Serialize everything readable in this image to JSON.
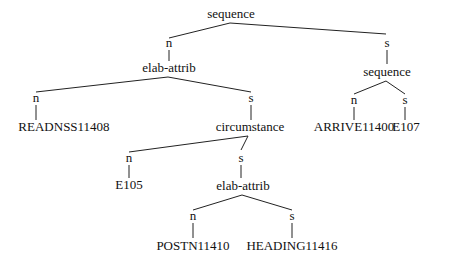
{
  "diagram": {
    "type": "rst-tree",
    "nodes": [
      {
        "id": "root",
        "label": "sequence",
        "x": 231,
        "y": 18
      },
      {
        "id": "n1",
        "label": "n",
        "x": 169,
        "y": 47
      },
      {
        "id": "s1",
        "label": "s",
        "x": 387,
        "y": 47
      },
      {
        "id": "elab1",
        "label": "elab-attrib",
        "x": 169,
        "y": 72
      },
      {
        "id": "seq2",
        "label": "sequence",
        "x": 387,
        "y": 76
      },
      {
        "id": "n2",
        "label": "n",
        "x": 36,
        "y": 102
      },
      {
        "id": "s2",
        "label": "s",
        "x": 251,
        "y": 102
      },
      {
        "id": "n5",
        "label": "n",
        "x": 354,
        "y": 104
      },
      {
        "id": "s5",
        "label": "s",
        "x": 405,
        "y": 104
      },
      {
        "id": "readnss",
        "label": "READNSS11408",
        "x": 64,
        "y": 131
      },
      {
        "id": "circ",
        "label": "circumstance",
        "x": 250,
        "y": 131
      },
      {
        "id": "arrive",
        "label": "ARRIVE11400",
        "x": 354,
        "y": 131
      },
      {
        "id": "e107",
        "label": "E107",
        "x": 406,
        "y": 131
      },
      {
        "id": "n3",
        "label": "n",
        "x": 129,
        "y": 162
      },
      {
        "id": "s3",
        "label": "s",
        "x": 241,
        "y": 162
      },
      {
        "id": "e105",
        "label": "E105",
        "x": 129,
        "y": 189
      },
      {
        "id": "elab2",
        "label": "elab-attrib",
        "x": 243,
        "y": 190
      },
      {
        "id": "n4",
        "label": "n",
        "x": 193,
        "y": 220
      },
      {
        "id": "s4",
        "label": "s",
        "x": 292,
        "y": 220
      },
      {
        "id": "postn",
        "label": "POSTN11410",
        "x": 193,
        "y": 250
      },
      {
        "id": "heading",
        "label": "HEADING11416",
        "x": 292,
        "y": 250
      }
    ],
    "edges": [
      {
        "from": "root",
        "to": "n1",
        "x1": 230,
        "y1": 23,
        "x2": 169,
        "y2": 38
      },
      {
        "from": "root",
        "to": "s1",
        "x1": 230,
        "y1": 23,
        "x2": 386,
        "y2": 34
      },
      {
        "from": "n1",
        "to": "elab1",
        "x1": 169,
        "y1": 50,
        "x2": 169,
        "y2": 61
      },
      {
        "from": "s1",
        "to": "seq2",
        "x1": 387,
        "y1": 50,
        "x2": 387,
        "y2": 64
      },
      {
        "from": "elab1",
        "to": "n2",
        "x1": 168,
        "y1": 77,
        "x2": 36,
        "y2": 92
      },
      {
        "from": "elab1",
        "to": "s2",
        "x1": 168,
        "y1": 77,
        "x2": 251,
        "y2": 92
      },
      {
        "from": "n2",
        "to": "readnss",
        "x1": 36,
        "y1": 105,
        "x2": 36,
        "y2": 120
      },
      {
        "from": "s2",
        "to": "circ",
        "x1": 251,
        "y1": 105,
        "x2": 251,
        "y2": 120
      },
      {
        "from": "seq2",
        "to": "n5",
        "x1": 386,
        "y1": 81,
        "x2": 354,
        "y2": 94
      },
      {
        "from": "seq2",
        "to": "s5",
        "x1": 386,
        "y1": 81,
        "x2": 405,
        "y2": 94
      },
      {
        "from": "n5",
        "to": "arrive",
        "x1": 354,
        "y1": 107,
        "x2": 354,
        "y2": 120
      },
      {
        "from": "s5",
        "to": "e107",
        "x1": 405,
        "y1": 107,
        "x2": 405,
        "y2": 120
      },
      {
        "from": "circ",
        "to": "n3",
        "x1": 248,
        "y1": 136,
        "x2": 129,
        "y2": 152
      },
      {
        "from": "circ",
        "to": "s3",
        "x1": 248,
        "y1": 136,
        "x2": 241,
        "y2": 150
      },
      {
        "from": "n3",
        "to": "e105",
        "x1": 129,
        "y1": 165,
        "x2": 129,
        "y2": 178
      },
      {
        "from": "s3",
        "to": "elab2",
        "x1": 241,
        "y1": 165,
        "x2": 241,
        "y2": 178
      },
      {
        "from": "elab2",
        "to": "n4",
        "x1": 242,
        "y1": 195,
        "x2": 193,
        "y2": 210
      },
      {
        "from": "elab2",
        "to": "s4",
        "x1": 242,
        "y1": 195,
        "x2": 292,
        "y2": 210
      },
      {
        "from": "n4",
        "to": "postn",
        "x1": 193,
        "y1": 223,
        "x2": 193,
        "y2": 238
      },
      {
        "from": "s4",
        "to": "heading",
        "x1": 292,
        "y1": 223,
        "x2": 292,
        "y2": 238
      }
    ]
  }
}
